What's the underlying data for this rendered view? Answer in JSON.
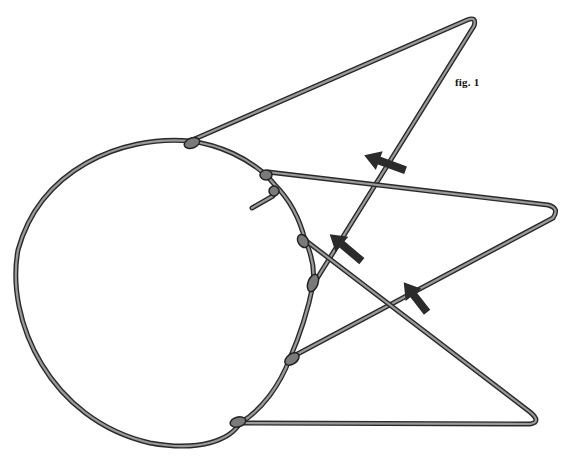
{
  "figure": {
    "caption": "fig. 1",
    "colors": {
      "wire_edge": "#2a2a2a",
      "wire_fill": "#9a9a9a",
      "arrow": "#2b2b2b",
      "background": "#ffffff"
    },
    "arrows": [
      {
        "name": "arrow-upper",
        "direction": "up-left"
      },
      {
        "name": "arrow-middle",
        "direction": "up-left"
      },
      {
        "name": "arrow-lower",
        "direction": "up-left"
      }
    ]
  }
}
